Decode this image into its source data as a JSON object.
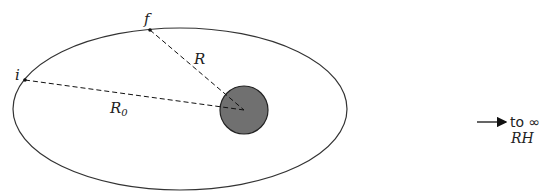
{
  "diagram": {
    "orbit": {
      "cx": 180,
      "cy": 109,
      "rx": 167,
      "ry": 81,
      "stroke": "#333333"
    },
    "body": {
      "cx": 244,
      "cy": 110,
      "r": 24,
      "fill": "#707070",
      "stroke": "#222222"
    },
    "points": {
      "initial": {
        "label": "i",
        "x": 25,
        "y": 80
      },
      "final": {
        "label": "f",
        "x": 150,
        "y": 30
      }
    },
    "distances": {
      "R": {
        "label": "R"
      },
      "R0": {
        "label": "R",
        "subscript": "0"
      }
    },
    "infinity_arrow": {
      "label": "to ∞",
      "sublabel": "RH"
    }
  }
}
